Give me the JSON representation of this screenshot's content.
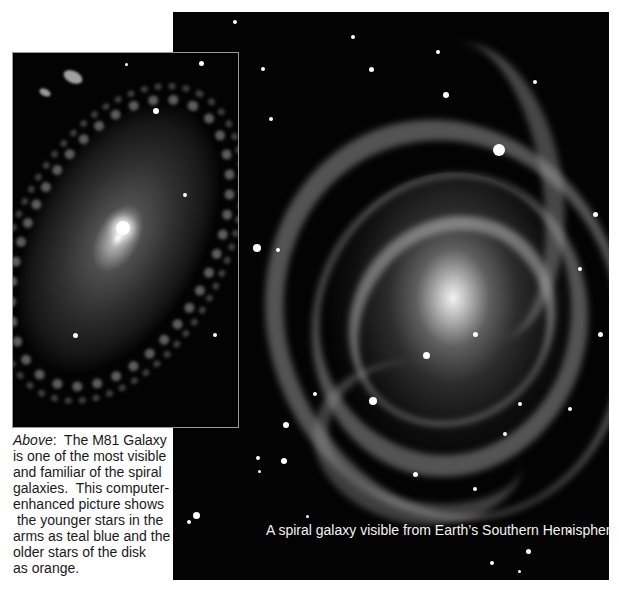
{
  "figures": [
    {
      "id": "m81",
      "subject": "M81 Galaxy (spiral galaxy, grayscale photo)",
      "caption": {
        "lead_italic": "Above",
        "lead_suffix": ":",
        "lines": [
          "  The M81 Galaxy",
          "is one of the most visible",
          "and familiar of the spiral",
          "galaxies.  This computer-",
          "enhanced picture shows",
          " the younger stars in the",
          "arms as teal blue and the",
          "older stars of the disk",
          "as orange."
        ]
      }
    },
    {
      "id": "southern-spiral",
      "subject": "Face-on spiral galaxy (grayscale photo)",
      "caption": {
        "text": "A spiral galaxy visible from Earth’s Southern Hemisphere."
      }
    }
  ],
  "colors": {
    "page_background": "#ffffff",
    "photo_background": "#030303",
    "caption_dark": "#1a1a1a",
    "caption_light": "#f2f2f2",
    "left_photo_border": "#9a9a9a"
  }
}
